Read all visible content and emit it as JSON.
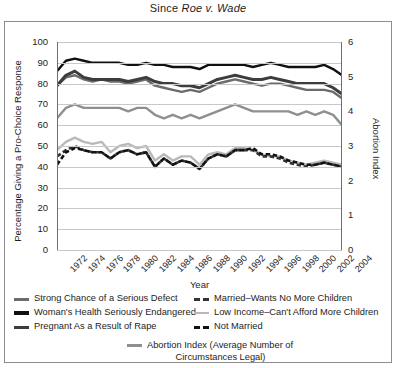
{
  "title": {
    "prefix": "Since ",
    "case": "Roe v. Wade"
  },
  "axes": {
    "xlabel": "Year",
    "ylabel_left": "Percentage Giving a Pro-Choice Response",
    "ylabel_right": "Abortion Index",
    "yticks_left": [
      "100",
      "90",
      "80",
      "70",
      "60",
      "50",
      "40",
      "30",
      "20",
      "10",
      "0"
    ],
    "yticks_right": [
      "6",
      "5",
      "4",
      "3",
      "2",
      "1",
      "0"
    ],
    "xticks": [
      "1972",
      "1974",
      "1976",
      "1978",
      "1980",
      "1982",
      "1984",
      "1986",
      "1988",
      "1990",
      "1992",
      "1994",
      "1996",
      "1998",
      "2000",
      "2002",
      "2004"
    ]
  },
  "colors": {
    "serious_defect": "#6b6b6b",
    "womans_health": "#111111",
    "rape": "#3d3d3d",
    "married_no_more": "#333333",
    "low_income": "#b9b9b9",
    "not_married": "#111111",
    "abortion_index": "#8f8f8f",
    "grid": "#c8c8c8",
    "axis": "#6f6f6f",
    "frame": "#8d8d8d"
  },
  "legend": {
    "left_items": [
      {
        "label": "Strong Chance of a Serious Defect",
        "style": "solid",
        "color": "#6b6b6b",
        "width": 3
      },
      {
        "label": "Woman's Health Seriously Endangered",
        "style": "solid",
        "color": "#111111",
        "width": 3.5
      },
      {
        "label": "Pregnant As a Result of Rape",
        "style": "solid",
        "color": "#3d3d3d",
        "width": 3
      }
    ],
    "right_items": [
      {
        "label": "Married–Wants No More Children",
        "style": "dashed",
        "color": "#333333",
        "width": 3
      },
      {
        "label": "Low Income–Can't Afford More Children",
        "style": "solid",
        "color": "#b9b9b9",
        "width": 2.5
      },
      {
        "label": "Not Married",
        "style": "dashed",
        "color": "#111111",
        "width": 3
      }
    ],
    "centered_item": {
      "label_line1": "Abortion Index (Average Number of",
      "label_line2": "Circumstances Legal)",
      "style": "solid",
      "color": "#8f8f8f",
      "width": 2.5
    }
  },
  "chart_data": {
    "type": "line",
    "title": "Since Roe v. Wade",
    "xlabel": "Year",
    "ylabel": "Percentage Giving a Pro-Choice Response",
    "ylabel_secondary": "Abortion Index",
    "ylim": [
      0,
      100
    ],
    "ylim_secondary": [
      0,
      6
    ],
    "grid": true,
    "legend_position": "bottom",
    "x": [
      1972,
      1973,
      1974,
      1975,
      1976,
      1977,
      1978,
      1979,
      1980,
      1981,
      1982,
      1983,
      1984,
      1985,
      1986,
      1987,
      1988,
      1989,
      1990,
      1991,
      1992,
      1993,
      1994,
      1995,
      1996,
      1997,
      1998,
      1999,
      2000,
      2001,
      2002,
      2003,
      2004
    ],
    "series": [
      {
        "name": "Woman's Health Seriously Endangered",
        "axis": "left",
        "color": "#111111",
        "style": "solid",
        "values": [
          86,
          91,
          92,
          91,
          90,
          90,
          90,
          90,
          89,
          89,
          90,
          89,
          89,
          88,
          88,
          88,
          87,
          89,
          89,
          89,
          89,
          89,
          88,
          89,
          90,
          89,
          88,
          88,
          88,
          88,
          89,
          87,
          84
        ]
      },
      {
        "name": "Pregnant As a Result of Rape",
        "axis": "left",
        "color": "#3d3d3d",
        "style": "solid",
        "values": [
          79,
          84,
          86,
          83,
          82,
          82,
          82,
          82,
          81,
          82,
          83,
          81,
          80,
          80,
          79,
          79,
          78,
          80,
          82,
          83,
          84,
          83,
          82,
          82,
          83,
          82,
          81,
          80,
          80,
          80,
          80,
          78,
          75
        ]
      },
      {
        "name": "Strong Chance of a Serious Defect",
        "axis": "left",
        "color": "#6b6b6b",
        "style": "solid",
        "values": [
          79,
          83,
          84,
          82,
          81,
          82,
          81,
          81,
          80,
          81,
          82,
          79,
          78,
          77,
          76,
          77,
          76,
          78,
          80,
          81,
          82,
          81,
          80,
          79,
          80,
          80,
          79,
          78,
          77,
          77,
          77,
          76,
          73
        ]
      },
      {
        "name": "Abortion Index (Average Number of Circumstances Legal)",
        "axis": "right",
        "color": "#8f8f8f",
        "style": "solid",
        "values": [
          3.8,
          4.1,
          4.2,
          4.1,
          4.1,
          4.1,
          4.1,
          4.1,
          4.0,
          4.1,
          4.1,
          3.9,
          3.8,
          3.9,
          3.8,
          3.9,
          3.8,
          3.9,
          4.0,
          4.1,
          4.2,
          4.1,
          4.0,
          4.0,
          4.0,
          4.0,
          4.0,
          3.9,
          4.0,
          3.9,
          4.0,
          3.9,
          3.6
        ]
      },
      {
        "name": "Low Income–Can't Afford More Children",
        "axis": "left",
        "color": "#b9b9b9",
        "style": "solid",
        "values": [
          48,
          52,
          54,
          52,
          51,
          52,
          47,
          50,
          51,
          49,
          50,
          43,
          46,
          43,
          45,
          45,
          41,
          46,
          47,
          46,
          49,
          49,
          48,
          46,
          45,
          45,
          43,
          42,
          41,
          42,
          43,
          42,
          41
        ]
      },
      {
        "name": "Married–Wants No More Children",
        "axis": "left",
        "color": "#333333",
        "style": "dashed",
        "values": [
          45,
          48,
          50,
          48,
          47,
          47,
          44,
          47,
          48,
          46,
          47,
          40,
          44,
          41,
          43,
          42,
          39,
          44,
          46,
          45,
          48,
          48,
          48,
          45,
          45,
          44,
          42,
          41,
          40,
          41,
          42,
          41,
          40
        ]
      },
      {
        "name": "Not Married",
        "axis": "left",
        "color": "#111111",
        "style": "dashed",
        "values": [
          41,
          47,
          49,
          48,
          47,
          47,
          44,
          47,
          48,
          46,
          47,
          40,
          44,
          41,
          43,
          42,
          39,
          44,
          46,
          45,
          48,
          48,
          49,
          46,
          46,
          45,
          43,
          42,
          41,
          41,
          42,
          41,
          40
        ]
      }
    ]
  }
}
